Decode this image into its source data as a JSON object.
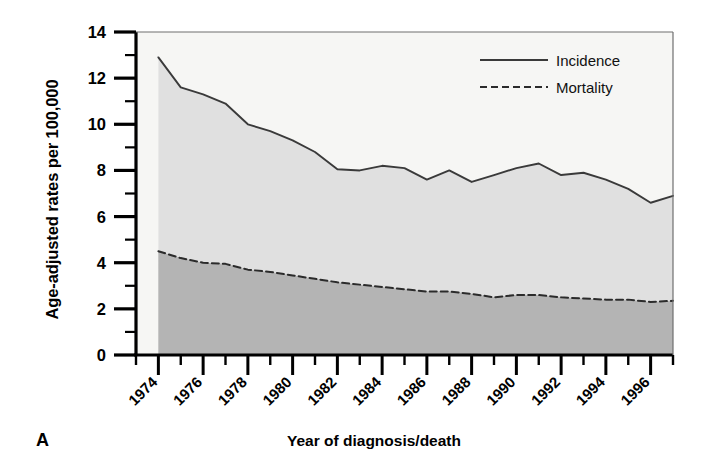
{
  "panel": {
    "letter": "A"
  },
  "chart_data": {
    "type": "area",
    "title": "",
    "xlabel": "Year of diagnosis/death",
    "ylabel": "Age-adjusted rates per 100,000",
    "ylim": [
      0,
      14
    ],
    "xlim": [
      1973,
      1997
    ],
    "yticks": [
      0,
      2,
      4,
      6,
      8,
      10,
      12,
      14
    ],
    "ytick_labels": [
      "0",
      "2",
      "4",
      "6",
      "8",
      "10",
      "12",
      "14"
    ],
    "xticks": [
      1974,
      1976,
      1978,
      1980,
      1982,
      1984,
      1986,
      1988,
      1990,
      1992,
      1994,
      1996
    ],
    "xtick_labels": [
      "1974",
      "1976",
      "1978",
      "1980",
      "1982",
      "1984",
      "1986",
      "1988",
      "1990",
      "1992",
      "1994",
      "1996"
    ],
    "minor_xticks": [
      1973,
      1975,
      1977,
      1979,
      1981,
      1983,
      1985,
      1987,
      1989,
      1991,
      1993,
      1995,
      1997
    ],
    "grid": false,
    "legend_position": "top-right",
    "x": [
      1974,
      1975,
      1976,
      1977,
      1978,
      1979,
      1980,
      1981,
      1982,
      1983,
      1984,
      1985,
      1986,
      1987,
      1988,
      1989,
      1990,
      1991,
      1992,
      1993,
      1994,
      1995,
      1996,
      1997
    ],
    "series": [
      {
        "name": "Incidence",
        "style": "solid",
        "line_color": "#3a3a3a",
        "fill_color": "#e0e0e0",
        "values": [
          12.9,
          11.6,
          11.3,
          10.9,
          10.0,
          9.7,
          9.3,
          8.8,
          8.05,
          8.0,
          8.2,
          8.1,
          7.6,
          8.0,
          7.5,
          7.8,
          8.1,
          8.3,
          7.8,
          7.9,
          7.6,
          7.2,
          6.6,
          6.9
        ]
      },
      {
        "name": "Mortality",
        "style": "dashed",
        "line_color": "#2b2b2b",
        "fill_color": "#b4b4b4",
        "values": [
          4.5,
          4.2,
          4.0,
          3.95,
          3.7,
          3.6,
          3.45,
          3.3,
          3.15,
          3.05,
          2.95,
          2.85,
          2.75,
          2.75,
          2.65,
          2.5,
          2.6,
          2.6,
          2.5,
          2.45,
          2.4,
          2.4,
          2.3,
          2.35
        ]
      }
    ]
  },
  "legend": {
    "items": [
      {
        "label": "Incidence",
        "style": "solid"
      },
      {
        "label": "Mortality",
        "style": "dashed"
      }
    ]
  },
  "axes_color": "#000000",
  "plot_background": "#ffffff"
}
